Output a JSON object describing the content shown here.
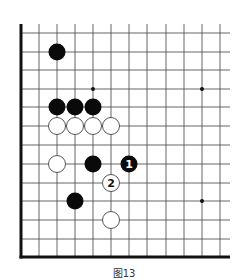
{
  "diagram": {
    "caption": "图13",
    "board": {
      "grid_x": [
        21,
        39,
        57,
        75,
        93,
        111,
        129,
        147,
        166,
        184,
        202,
        220
      ],
      "grid_y": [
        33,
        52,
        70,
        89,
        107,
        126,
        145,
        164,
        183,
        201,
        220,
        239,
        257
      ],
      "top_edge_y": 24,
      "right_extent_x": 230,
      "left_edge": "thick",
      "bottom_edge": "thick",
      "line_color": "#555555",
      "edge_color": "#111111",
      "star_points": [
        [
          4,
          3
        ],
        [
          10,
          3
        ],
        [
          10,
          9
        ]
      ],
      "stone_radius": 8.5
    },
    "stones": [
      {
        "color": "black",
        "col": 2,
        "row": 1,
        "label": ""
      },
      {
        "color": "black",
        "col": 2,
        "row": 4,
        "label": ""
      },
      {
        "color": "black",
        "col": 3,
        "row": 4,
        "label": ""
      },
      {
        "color": "black",
        "col": 4,
        "row": 4,
        "label": ""
      },
      {
        "color": "white",
        "col": 2,
        "row": 5,
        "label": ""
      },
      {
        "color": "white",
        "col": 3,
        "row": 5,
        "label": ""
      },
      {
        "color": "white",
        "col": 4,
        "row": 5,
        "label": ""
      },
      {
        "color": "white",
        "col": 5,
        "row": 5,
        "label": ""
      },
      {
        "color": "white",
        "col": 2,
        "row": 7,
        "label": ""
      },
      {
        "color": "black",
        "col": 4,
        "row": 7,
        "label": ""
      },
      {
        "color": "black",
        "col": 6,
        "row": 7,
        "label": "1"
      },
      {
        "color": "white",
        "col": 5,
        "row": 8,
        "label": "2"
      },
      {
        "color": "black",
        "col": 3,
        "row": 9,
        "label": ""
      },
      {
        "color": "white",
        "col": 5,
        "row": 10,
        "label": ""
      }
    ]
  }
}
